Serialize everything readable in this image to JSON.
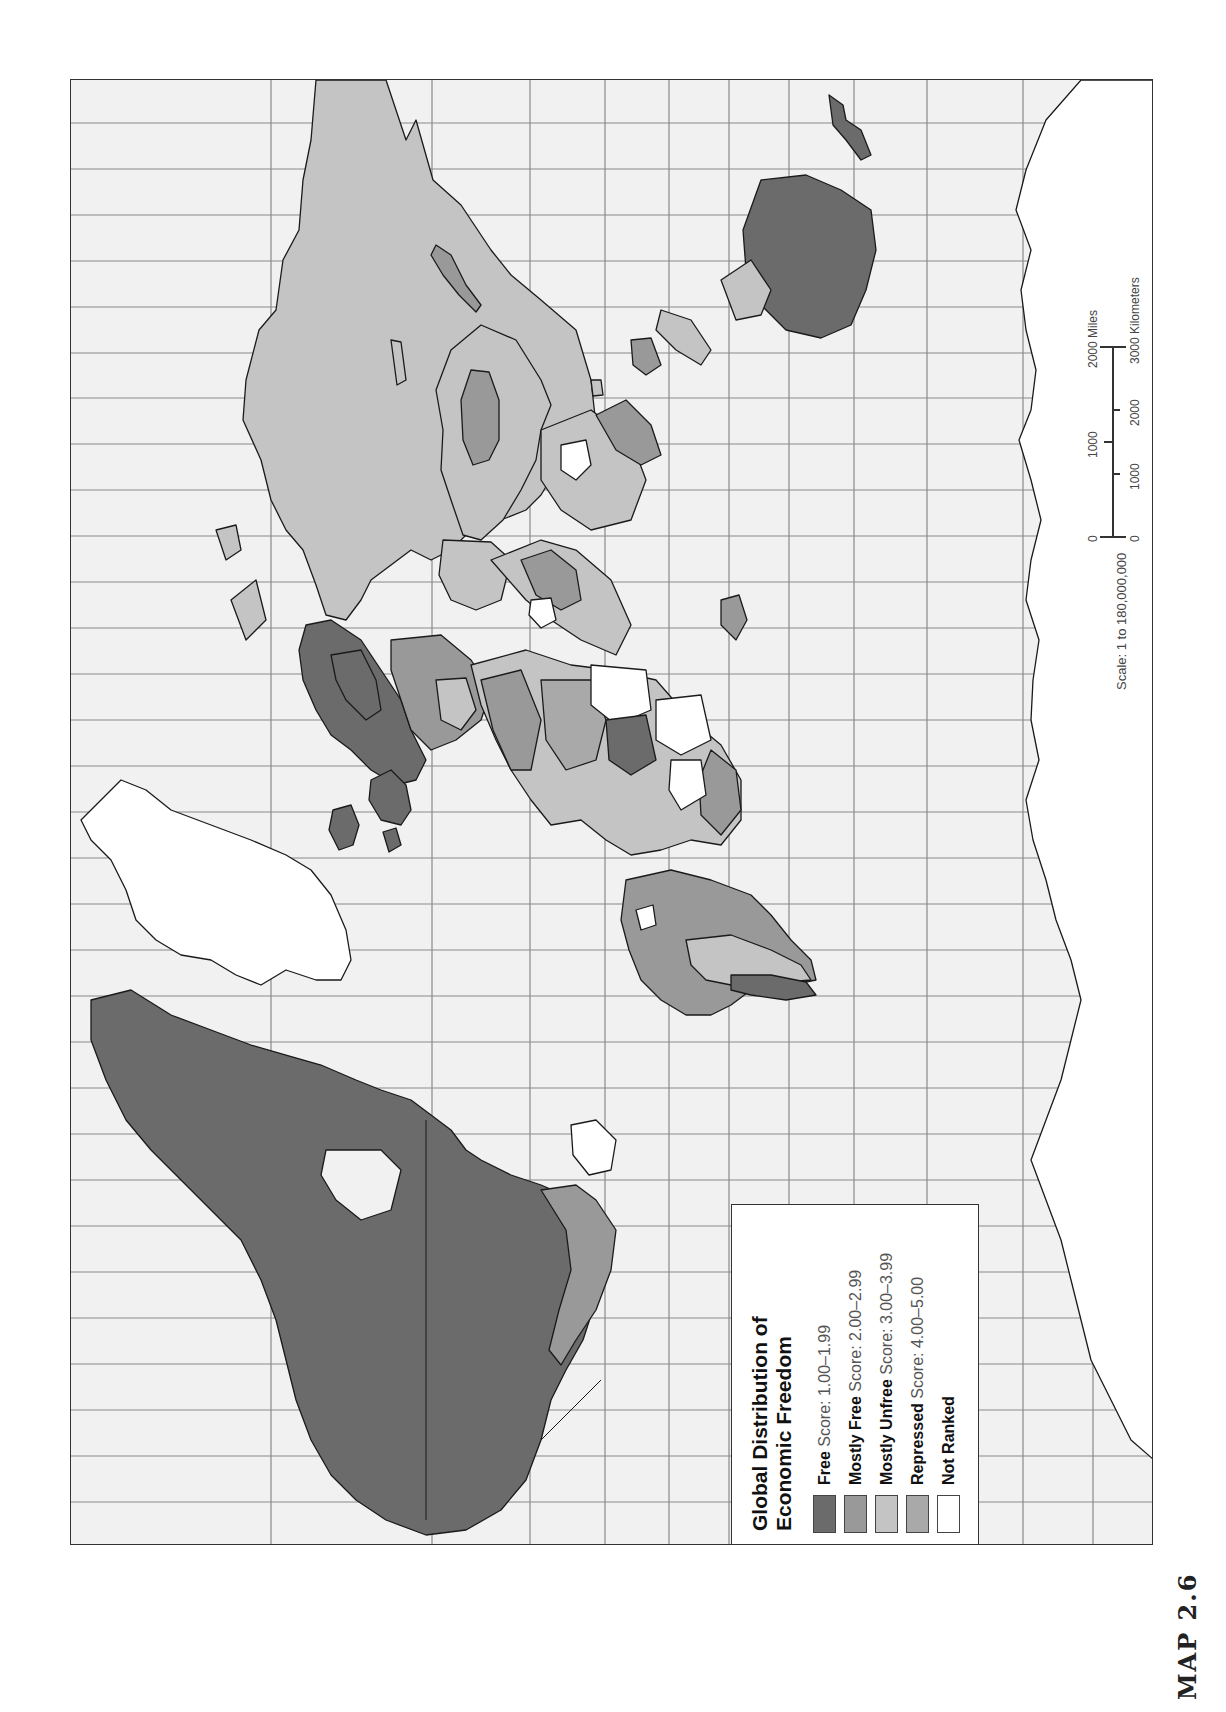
{
  "map": {
    "figure_label": "MAP 2.6",
    "orientation": "rotated 90° counter-clockwise (north to the left)",
    "legend": {
      "title_line1": "Global Distribution of",
      "title_line2": "Economic Freedom",
      "items": [
        {
          "name": "Free",
          "score": "Score: 1.00–1.99",
          "color": "#6b6b6b"
        },
        {
          "name": "Mostly Free",
          "score": "Score: 2.00–2.99",
          "color": "#999999"
        },
        {
          "name": "Mostly Unfree",
          "score": "Score: 3.00–3.99",
          "color": "#c4c4c4"
        },
        {
          "name": "Repressed",
          "score": "Score: 4.00–5.00",
          "color": "#a9a9a9"
        },
        {
          "name": "Not Ranked",
          "score": "",
          "color": "#ffffff"
        }
      ]
    },
    "scale": {
      "text": "Scale:  1 to 180,000,000",
      "miles_ticks": [
        "0",
        "1000",
        "2000 Miles"
      ],
      "km_ticks": [
        "0",
        "1000",
        "2000",
        "3000 Kilometers"
      ]
    },
    "colors": {
      "ocean": "#f1f1f1",
      "gridline": "#8a8a8a",
      "border": "#1a1a1a",
      "free": "#6b6b6b",
      "mostly_free": "#999999",
      "mostly_unfree": "#c4c4c4",
      "repressed": "#a9a9a9",
      "not_ranked": "#ffffff"
    },
    "regions": [
      {
        "name": "North America (USA/Canada)",
        "category": "Free"
      },
      {
        "name": "Greenland",
        "category": "Not Ranked"
      },
      {
        "name": "Mexico",
        "category": "Mostly Free"
      },
      {
        "name": "South America",
        "category": "Mostly Free / Mostly Unfree"
      },
      {
        "name": "Western Europe",
        "category": "Free"
      },
      {
        "name": "Iceland",
        "category": "Free"
      },
      {
        "name": "Russia",
        "category": "Mostly Unfree"
      },
      {
        "name": "China",
        "category": "Mostly Unfree"
      },
      {
        "name": "Mongolia",
        "category": "Mostly Free"
      },
      {
        "name": "Africa",
        "category": "Mixed"
      },
      {
        "name": "Australia",
        "category": "Free"
      },
      {
        "name": "New Zealand",
        "category": "Free"
      },
      {
        "name": "Antarctica",
        "category": "Not Ranked"
      }
    ]
  }
}
